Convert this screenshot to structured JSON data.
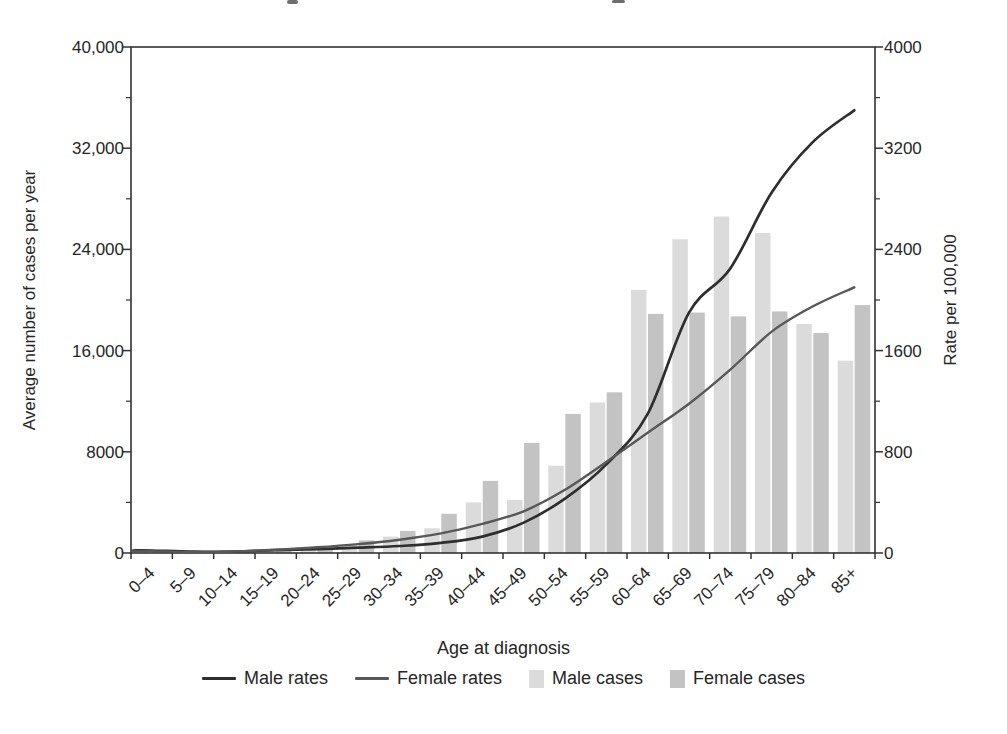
{
  "chart_data": {
    "type": "combo-bar-line",
    "categories": [
      "0–4",
      "5–9",
      "10–14",
      "15–19",
      "20–24",
      "25–29",
      "30–34",
      "35–39",
      "40–44",
      "45–49",
      "50–54",
      "55–59",
      "60–64",
      "65–69",
      "70–74",
      "75–79",
      "80–84",
      "85+"
    ],
    "series": [
      {
        "name": "Male rates",
        "type": "line",
        "axis": "right",
        "color": "#2e2e2e",
        "values": [
          20,
          10,
          12,
          22,
          30,
          42,
          55,
          80,
          130,
          240,
          430,
          700,
          1100,
          1900,
          2250,
          2850,
          3250,
          3500
        ]
      },
      {
        "name": "Female rates",
        "type": "line",
        "axis": "right",
        "color": "#585858",
        "values": [
          15,
          8,
          12,
          25,
          45,
          70,
          105,
          155,
          230,
          330,
          500,
          720,
          950,
          1180,
          1450,
          1750,
          1950,
          2100
        ]
      },
      {
        "name": "Male cases",
        "type": "bar",
        "axis": "left",
        "color": "#dbdbdb",
        "values": [
          150,
          90,
          110,
          190,
          290,
          650,
          1300,
          1950,
          4000,
          4200,
          6900,
          11900,
          20800,
          24800,
          26600,
          25300,
          18100,
          15200
        ]
      },
      {
        "name": "Female cases",
        "type": "bar",
        "axis": "left",
        "color": "#c3c3c3",
        "values": [
          100,
          70,
          90,
          190,
          380,
          1000,
          1750,
          3100,
          5700,
          8700,
          11000,
          12700,
          18900,
          19000,
          18700,
          19100,
          17400,
          19600
        ]
      }
    ],
    "xlabel": "Age at diagnosis",
    "ylabel_left": "Average number of cases per year",
    "ylabel_right": "Rate per 100,000",
    "ylim_left": [
      0,
      40000
    ],
    "ylim_right": [
      0,
      4000
    ],
    "left_tick_labels": [
      "0",
      "8000",
      "16,000",
      "24,000",
      "32,000",
      "40,000"
    ],
    "right_tick_labels": [
      "0",
      "800",
      "1600",
      "2400",
      "3200",
      "4000"
    ],
    "minor_ticks_left_step": 4000,
    "minor_ticks_right_step": 400,
    "grid": false,
    "legend_position": "bottom",
    "axis_color": "#333333"
  }
}
